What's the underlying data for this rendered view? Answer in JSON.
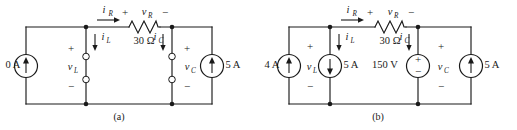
{
  "figure": {
    "caption_a": "(a)",
    "caption_b": "(b)"
  },
  "circuit_a": {
    "label": "(a)",
    "source_left": {
      "name": "current-source-0a",
      "value": "0 A",
      "type": "current",
      "direction": "up"
    },
    "source_right": {
      "name": "current-source-5a-right",
      "value": "5 A",
      "type": "current",
      "direction": "up"
    },
    "resistor": {
      "name": "resistor-30ohm",
      "value": "30 Ω",
      "voltage_var": "v",
      "voltage_sub": "R",
      "current_var": "i",
      "current_sub": "R",
      "plus": "+",
      "minus": "−"
    },
    "inductor_branch": {
      "name": "inductor-terminals",
      "voltage_var": "v",
      "voltage_sub": "L",
      "current_var": "i",
      "current_sub": "L",
      "plus": "+",
      "minus": "−"
    },
    "capacitor_branch": {
      "name": "capacitor-terminals",
      "voltage_var": "v",
      "voltage_sub": "C",
      "current_var": "i",
      "current_sub": "C",
      "plus": "+",
      "minus": "−"
    }
  },
  "circuit_b": {
    "label": "(b)",
    "source_left": {
      "name": "current-source-4a",
      "value": "4 A",
      "type": "current",
      "direction": "up"
    },
    "source_inductor": {
      "name": "current-source-5a-inductor",
      "value": "5 A",
      "type": "current",
      "direction": "down"
    },
    "source_capacitor": {
      "name": "voltage-source-150v",
      "value": "150 V",
      "type": "voltage",
      "plus": "+",
      "minus": "−"
    },
    "source_right": {
      "name": "current-source-5a-right",
      "value": "5 A",
      "type": "current",
      "direction": "up"
    },
    "resistor": {
      "name": "resistor-30ohm",
      "value": "30 Ω",
      "voltage_var": "v",
      "voltage_sub": "R",
      "current_var": "i",
      "current_sub": "R",
      "plus": "+",
      "minus": "−"
    },
    "inductor_branch": {
      "name": "inductor-branch",
      "voltage_var": "v",
      "voltage_sub": "L",
      "current_var": "i",
      "current_sub": "L",
      "plus": "+",
      "minus": "−"
    },
    "capacitor_branch": {
      "name": "capacitor-branch",
      "voltage_var": "v",
      "voltage_sub": "C",
      "current_var": "i",
      "current_sub": "C",
      "plus": "+",
      "minus": "−"
    }
  },
  "colors": {
    "ink": "#1a1a1a",
    "background": "#ffffff"
  }
}
